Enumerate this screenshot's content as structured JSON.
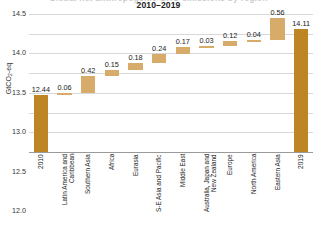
{
  "chart_data": {
    "type": "bar",
    "subtype": "waterfall",
    "title": "Global net anthropogenic GHG emissions by region",
    "title_line2": "2010–2019",
    "xlabel": "",
    "ylabel": "GtCO₂-eq",
    "ylabel_main": "GtCO",
    "ylabel_sub": "2",
    "ylabel_tail": "-eq",
    "ylim": [
      11.0,
      14.5
    ],
    "yticks": [
      "14.5",
      "14.0",
      "13.5",
      "13.0",
      "12.5",
      "12.0",
      "11.5",
      "11.0"
    ],
    "ytick_values": [
      14.5,
      14.0,
      13.5,
      13.0,
      12.5,
      12.0,
      11.5,
      11.0
    ],
    "grid": true,
    "legend": "none",
    "categories": [
      "2010",
      "Latin America and Caribbean",
      "Southern Asia",
      "Africa",
      "Eurasia",
      "S-E Asia and Pacific",
      "Middle East",
      "Australia, Japan and New Zealand",
      "Europe",
      "North America",
      "Eastern Asia",
      "2019"
    ],
    "values": [
      12.44,
      0.06,
      0.42,
      0.15,
      0.18,
      0.24,
      0.17,
      0.03,
      0.12,
      0.04,
      0.56,
      14.11
    ],
    "labels": [
      "12.44",
      "0.06",
      "0.42",
      "0.15",
      "0.18",
      "0.24",
      "0.17",
      "0.03",
      "0.12",
      "0.04",
      "0.56",
      "14.11"
    ],
    "bar_kinds": [
      "total",
      "delta",
      "delta",
      "delta",
      "delta",
      "delta",
      "delta",
      "delta",
      "delta",
      "delta",
      "delta",
      "total"
    ],
    "cumulative_base": [
      11.0,
      12.44,
      12.5,
      12.92,
      13.07,
      13.25,
      13.49,
      13.66,
      13.69,
      13.81,
      13.85,
      11.0
    ],
    "cumulative_top": [
      12.44,
      12.5,
      12.92,
      13.07,
      13.25,
      13.49,
      13.66,
      13.69,
      13.81,
      13.85,
      14.41,
      14.11
    ],
    "colors": {
      "total_bar": "#bd8524",
      "delta_bar": "#d7ab6a",
      "gridline": "#d8d8d8",
      "baseline": "#9a9a9a",
      "text": "#1a1a1a",
      "background": "#ffffff"
    }
  }
}
